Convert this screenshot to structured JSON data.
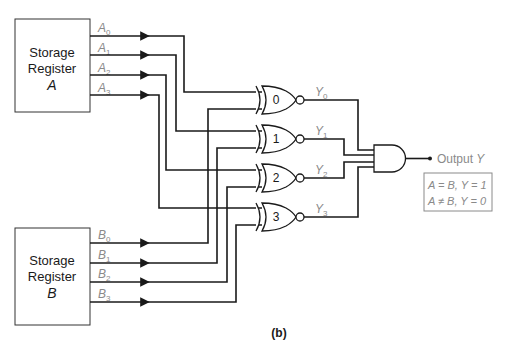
{
  "register_a": {
    "line1": "Storage",
    "line2": "Register",
    "letter": "A",
    "outputs": [
      {
        "base": "A",
        "sub": "0"
      },
      {
        "base": "A",
        "sub": "1"
      },
      {
        "base": "A",
        "sub": "2"
      },
      {
        "base": "A",
        "sub": "3"
      }
    ]
  },
  "register_b": {
    "line1": "Storage",
    "line2": "Register",
    "letter": "B",
    "outputs": [
      {
        "base": "B",
        "sub": "0"
      },
      {
        "base": "B",
        "sub": "1"
      },
      {
        "base": "B",
        "sub": "2"
      },
      {
        "base": "B",
        "sub": "3"
      }
    ]
  },
  "gates": [
    {
      "label": "0",
      "type": "XNOR",
      "output": {
        "base": "Y",
        "sub": "0"
      }
    },
    {
      "label": "1",
      "type": "XNOR",
      "output": {
        "base": "Y",
        "sub": "1"
      }
    },
    {
      "label": "2",
      "type": "XNOR",
      "output": {
        "base": "Y",
        "sub": "2"
      }
    },
    {
      "label": "3",
      "type": "XNOR",
      "output": {
        "base": "Y",
        "sub": "3"
      }
    }
  ],
  "and_gate": {
    "type": "AND",
    "inputs": 4
  },
  "output": {
    "label": "Output ",
    "var": "Y"
  },
  "truth_box": {
    "line1": "A = B, Y = 1",
    "line2": "A ≠ B, Y = 0"
  },
  "caption": "(b)",
  "colors": {
    "wire": "#1a1a1a",
    "label_gray": "#8a8a8a",
    "background": "#ffffff"
  }
}
